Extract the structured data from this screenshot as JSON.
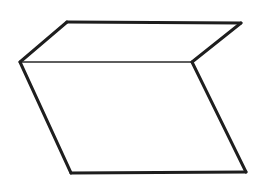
{
  "figure": {
    "stroke_color": "#1e1e1e",
    "background_color": "#ffffff",
    "vertices": {
      "top_left": [
        67,
        22
      ],
      "top_right": [
        241,
        23
      ],
      "mid_left": [
        20,
        62
      ],
      "mid_right": [
        192,
        62
      ],
      "bottom_left": [
        71,
        173
      ],
      "bottom_right": [
        246,
        172
      ]
    },
    "faces": [
      {
        "name": "top-face",
        "points": [
          "mid_left",
          "top_left",
          "top_right",
          "mid_right"
        ]
      },
      {
        "name": "front-face",
        "points": [
          "mid_left",
          "mid_right",
          "bottom_right",
          "bottom_left"
        ]
      }
    ]
  }
}
